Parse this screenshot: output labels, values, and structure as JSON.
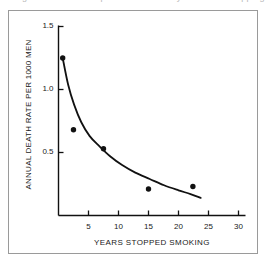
{
  "figure": {
    "top_clipped_caption": "Figure — relationship of death rate to years since stopping",
    "frame_color": "#9a9a9a",
    "background_color": "#ffffff",
    "ink_color": "#111111"
  },
  "chart_data": {
    "type": "scatter",
    "title": "",
    "subtitle": "",
    "xlabel": "YEARS STOPPED SMOKING",
    "ylabel": "ANNUAL DEATH RATE PER 1000 MEN",
    "xlim": [
      0,
      31
    ],
    "ylim": [
      0,
      1.6
    ],
    "grid": false,
    "legend": false,
    "legend_position": "none",
    "x_ticks": [
      5,
      10,
      15,
      20,
      25,
      30
    ],
    "x_tick_labels": [
      "5",
      "10",
      "15",
      "20",
      "25",
      "30"
    ],
    "y_ticks": [
      0.5,
      1.0,
      1.5
    ],
    "y_tick_labels": [
      "0.5",
      "1.0",
      "1.5"
    ],
    "series": [
      {
        "name": "Observed death rate",
        "type": "scatter",
        "marker": "filled-circle",
        "marker_color": "#111111",
        "points": [
          {
            "x": 0.7,
            "y": 1.25
          },
          {
            "x": 2.5,
            "y": 0.68
          },
          {
            "x": 7.5,
            "y": 0.53
          },
          {
            "x": 15.0,
            "y": 0.21
          },
          {
            "x": 22.4,
            "y": 0.23
          }
        ]
      },
      {
        "name": "Fitted decay curve",
        "type": "line",
        "line_color": "#111111",
        "points": [
          {
            "x": 0.7,
            "y": 1.25
          },
          {
            "x": 1.6,
            "y": 1.04
          },
          {
            "x": 2.6,
            "y": 0.88
          },
          {
            "x": 3.8,
            "y": 0.74
          },
          {
            "x": 5.2,
            "y": 0.63
          },
          {
            "x": 6.8,
            "y": 0.55
          },
          {
            "x": 8.6,
            "y": 0.47
          },
          {
            "x": 10.6,
            "y": 0.4
          },
          {
            "x": 12.8,
            "y": 0.34
          },
          {
            "x": 15.2,
            "y": 0.29
          },
          {
            "x": 17.6,
            "y": 0.24
          },
          {
            "x": 20.0,
            "y": 0.2
          },
          {
            "x": 22.0,
            "y": 0.17
          },
          {
            "x": 23.7,
            "y": 0.14
          }
        ]
      }
    ]
  }
}
